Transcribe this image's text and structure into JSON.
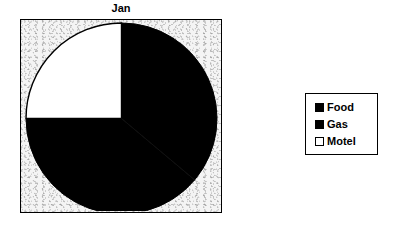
{
  "chart_data": {
    "type": "pie",
    "title": "Jan",
    "xlabel": "",
    "ylabel": "",
    "categories": [
      "Food",
      "Gas",
      "Motel"
    ],
    "values": [
      45,
      30,
      25
    ],
    "slices": [
      {
        "label": "Food",
        "value": 45,
        "percent": 45,
        "color": "#000000",
        "start_angle": 130,
        "end_angle": 270
      },
      {
        "label": "Gas",
        "value": 30,
        "percent": 30,
        "color": "#000000",
        "start_angle": 0,
        "end_angle": 130
      },
      {
        "label": "Motel",
        "value": 25,
        "percent": 25,
        "color": "#ffffff",
        "start_angle": 270,
        "end_angle": 360
      }
    ],
    "legend": {
      "position": "right",
      "entries": [
        {
          "label": "Food",
          "color": "#000000",
          "swatch": "filled"
        },
        {
          "label": "Gas",
          "color": "#000000",
          "swatch": "filled"
        },
        {
          "label": "Motel",
          "color": "#ffffff",
          "swatch": "empty"
        }
      ]
    },
    "grid": false,
    "plot_background": "#f4f4f4",
    "border_color": "#000000",
    "start_angle_note": "first slice begins at 12 o'clock, sweeping clockwise"
  },
  "chart": {
    "title": "Jan"
  },
  "legend": {
    "items": [
      {
        "label": "Food"
      },
      {
        "label": "Gas"
      },
      {
        "label": "Motel"
      }
    ]
  }
}
